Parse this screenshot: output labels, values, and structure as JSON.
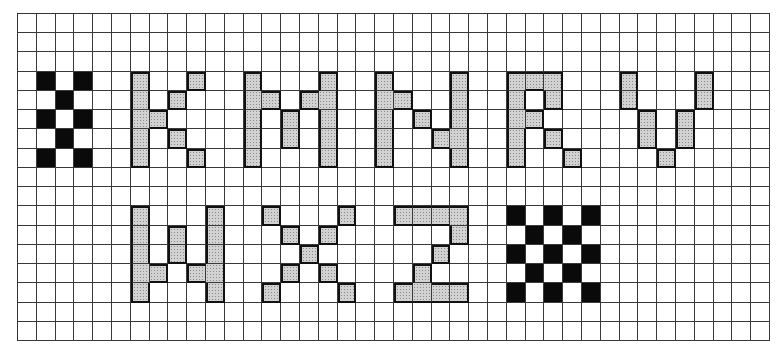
{
  "figure": {
    "grid": {
      "columns": 40,
      "rows": 17
    },
    "colors": {
      "grid_line": "#3a3a3a",
      "letter_fill": "#d2d2d2",
      "letter_outline": "#111111",
      "checker": "#0a0a0a",
      "background": "#ffffff"
    },
    "shapes": [
      {
        "name": "checker-small",
        "label": "checkerboard",
        "style": "black",
        "cells": [
          [
            3,
            1
          ],
          [
            3,
            3
          ],
          [
            4,
            2
          ],
          [
            5,
            1
          ],
          [
            5,
            3
          ],
          [
            6,
            2
          ],
          [
            7,
            1
          ],
          [
            7,
            3
          ]
        ]
      },
      {
        "name": "letter-k",
        "label": "K",
        "style": "gray",
        "cells": [
          [
            3,
            6
          ],
          [
            4,
            6
          ],
          [
            5,
            6
          ],
          [
            6,
            6
          ],
          [
            7,
            6
          ],
          [
            5,
            7
          ],
          [
            4,
            8
          ],
          [
            6,
            8
          ],
          [
            3,
            9
          ],
          [
            7,
            9
          ]
        ]
      },
      {
        "name": "letter-m",
        "label": "M",
        "style": "gray",
        "cells": [
          [
            3,
            12
          ],
          [
            4,
            12
          ],
          [
            5,
            12
          ],
          [
            6,
            12
          ],
          [
            7,
            12
          ],
          [
            4,
            13
          ],
          [
            5,
            14
          ],
          [
            6,
            14
          ],
          [
            4,
            15
          ],
          [
            3,
            16
          ],
          [
            4,
            16
          ],
          [
            5,
            16
          ],
          [
            6,
            16
          ],
          [
            7,
            16
          ]
        ]
      },
      {
        "name": "letter-n",
        "label": "N",
        "style": "gray",
        "cells": [
          [
            3,
            19
          ],
          [
            4,
            19
          ],
          [
            5,
            19
          ],
          [
            6,
            19
          ],
          [
            7,
            19
          ],
          [
            4,
            20
          ],
          [
            5,
            21
          ],
          [
            6,
            22
          ],
          [
            3,
            23
          ],
          [
            4,
            23
          ],
          [
            5,
            23
          ],
          [
            6,
            23
          ],
          [
            7,
            23
          ]
        ]
      },
      {
        "name": "letter-r",
        "label": "R",
        "style": "gray",
        "cells": [
          [
            3,
            26
          ],
          [
            4,
            26
          ],
          [
            5,
            26
          ],
          [
            6,
            26
          ],
          [
            7,
            26
          ],
          [
            3,
            27
          ],
          [
            5,
            27
          ],
          [
            3,
            28
          ],
          [
            4,
            28
          ],
          [
            6,
            28
          ],
          [
            7,
            29
          ]
        ]
      },
      {
        "name": "letter-v",
        "label": "V",
        "style": "gray",
        "cells": [
          [
            3,
            32
          ],
          [
            4,
            32
          ],
          [
            5,
            33
          ],
          [
            6,
            33
          ],
          [
            7,
            34
          ],
          [
            5,
            35
          ],
          [
            6,
            35
          ],
          [
            3,
            36
          ],
          [
            4,
            36
          ]
        ]
      },
      {
        "name": "letter-w",
        "label": "W",
        "style": "gray",
        "cells": [
          [
            10,
            6
          ],
          [
            11,
            6
          ],
          [
            12,
            6
          ],
          [
            13,
            6
          ],
          [
            14,
            6
          ],
          [
            13,
            7
          ],
          [
            11,
            8
          ],
          [
            12,
            8
          ],
          [
            13,
            9
          ],
          [
            10,
            10
          ],
          [
            11,
            10
          ],
          [
            12,
            10
          ],
          [
            13,
            10
          ],
          [
            14,
            10
          ]
        ]
      },
      {
        "name": "letter-x",
        "label": "X",
        "style": "gray",
        "cells": [
          [
            10,
            13
          ],
          [
            14,
            13
          ],
          [
            11,
            14
          ],
          [
            13,
            14
          ],
          [
            12,
            15
          ],
          [
            11,
            16
          ],
          [
            13,
            16
          ],
          [
            10,
            17
          ],
          [
            14,
            17
          ]
        ]
      },
      {
        "name": "letter-z",
        "label": "Z",
        "style": "gray",
        "cells": [
          [
            10,
            20
          ],
          [
            10,
            21
          ],
          [
            10,
            22
          ],
          [
            10,
            23
          ],
          [
            11,
            23
          ],
          [
            12,
            22
          ],
          [
            13,
            21
          ],
          [
            14,
            20
          ],
          [
            14,
            21
          ],
          [
            14,
            22
          ],
          [
            14,
            23
          ]
        ]
      },
      {
        "name": "checker-large",
        "label": "checkerboard",
        "style": "black",
        "cells": [
          [
            10,
            26
          ],
          [
            10,
            28
          ],
          [
            10,
            30
          ],
          [
            11,
            27
          ],
          [
            11,
            29
          ],
          [
            12,
            26
          ],
          [
            12,
            28
          ],
          [
            12,
            30
          ],
          [
            13,
            27
          ],
          [
            13,
            29
          ],
          [
            14,
            26
          ],
          [
            14,
            28
          ],
          [
            14,
            30
          ]
        ]
      }
    ]
  }
}
